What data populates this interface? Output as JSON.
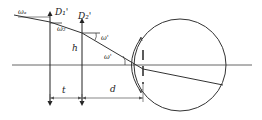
{
  "diagram": {
    "title": "",
    "labels": {
      "omega_a": "ωₐ",
      "omega_b": "ω₂",
      "D1": "D₁'",
      "D2": "D₂'",
      "h": "h",
      "omega_prime": "ω'",
      "omega_prime2": "ω'",
      "t": "t",
      "d": "d"
    },
    "colors": {
      "stroke": "#333333",
      "axis": "#555555",
      "background": "#ffffff"
    }
  }
}
